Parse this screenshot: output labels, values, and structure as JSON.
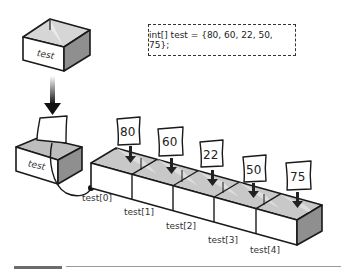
{
  "code": {
    "declaration": "int[] test = {80, 60, 22, 50, 75};"
  },
  "variable_box": {
    "label": "test"
  },
  "reference_box": {
    "label": "test"
  },
  "array": {
    "values": [
      "80",
      "60",
      "22",
      "50",
      "75"
    ],
    "index_labels": [
      "test[0]",
      "test[1]",
      "test[2]",
      "test[3]",
      "test[4]"
    ]
  },
  "colors": {
    "stroke": "#1a1a1a",
    "top_face": "#c8c8c8",
    "side_face": "#8f8f8f",
    "front_face": "#ffffff"
  }
}
